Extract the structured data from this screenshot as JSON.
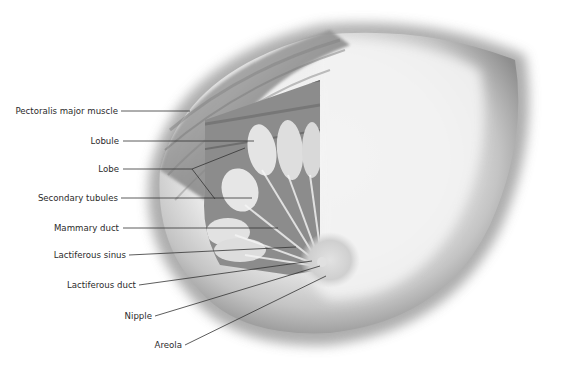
{
  "figure": {
    "palette": {
      "background": "#ffffff",
      "skin_light": "#f2f2f2",
      "skin_shadow": "#8a8a8a",
      "muscle": "#9a9a9a",
      "tissue": "#e6e6e6",
      "leader_line": "#333333",
      "label_text": "#2b2b2b"
    }
  },
  "labels": [
    {
      "id": "pectoralis",
      "text": "Pectoralis major muscle",
      "x": 120,
      "y": 111,
      "tx": 190,
      "ty": 111
    },
    {
      "id": "lobule",
      "text": "Lobule",
      "x": 122,
      "y": 141,
      "tx": 254,
      "ty": 141
    },
    {
      "id": "lobe",
      "text": "Lobe",
      "x": 122,
      "y": 169,
      "tx": 192,
      "ty": 169
    },
    {
      "id": "secondary-tubules",
      "text": "Secondary tubules",
      "x": 120,
      "y": 198,
      "tx": 252,
      "ty": 198
    },
    {
      "id": "mammary-duct",
      "text": "Mammary duct",
      "x": 122,
      "y": 228,
      "tx": 278,
      "ty": 228
    },
    {
      "id": "lactiferous-sinus",
      "text": "Lactiferous sinus",
      "x": 128,
      "y": 255,
      "tx": 296,
      "ty": 247
    },
    {
      "id": "lactiferous-duct",
      "text": "Lactiferous duct",
      "x": 138,
      "y": 285,
      "tx": 312,
      "ty": 261
    },
    {
      "id": "nipple",
      "text": "Nipple",
      "x": 153,
      "y": 316,
      "tx": 320,
      "ty": 266
    },
    {
      "id": "areola",
      "text": "Areola",
      "x": 183,
      "y": 345,
      "tx": 326,
      "ty": 276
    }
  ]
}
